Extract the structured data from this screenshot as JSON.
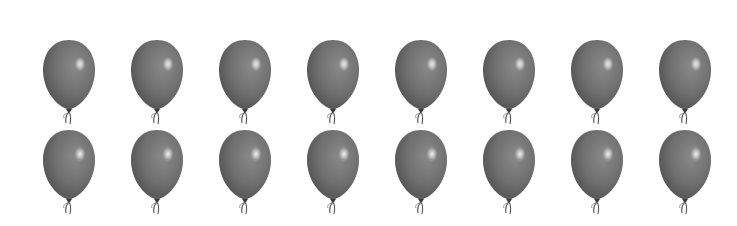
{
  "scene": {
    "background": "#ffffff",
    "balloon_color": "#6e6e6e",
    "balloon_dark": "#4a4a4a",
    "highlight_color": "#f4f4f4",
    "rows": 2,
    "columns": 8,
    "total_balloons": 16,
    "row_top_y": [
      40,
      130
    ],
    "column_center_x": [
      69,
      157,
      245,
      333,
      421,
      509,
      597,
      685
    ]
  }
}
